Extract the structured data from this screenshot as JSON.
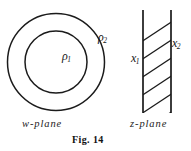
{
  "figure": {
    "number_caption": "Fig. 14",
    "stroke_color": "#1b1b1b",
    "background_color": "#ffffff"
  },
  "w_plane": {
    "caption": "w-plane",
    "inner_radius_label": "ρ",
    "inner_radius_subscript": "1",
    "outer_radius_label": "ρ",
    "outer_radius_subscript": "2",
    "shape": "annulus",
    "center_x": 56,
    "center_y": 62,
    "inner_radius": 31,
    "outer_radius": 49
  },
  "z_plane": {
    "caption": "z-plane",
    "left_boundary_label": "x",
    "left_boundary_subscript": "1",
    "right_boundary_label": "x",
    "right_boundary_subscript": "2",
    "shape": "vertical-hatched-strip",
    "left_line_x": 143,
    "right_line_x": 171,
    "line_top_y": 10,
    "line_bottom_y": 113,
    "hatch_count": 6
  }
}
